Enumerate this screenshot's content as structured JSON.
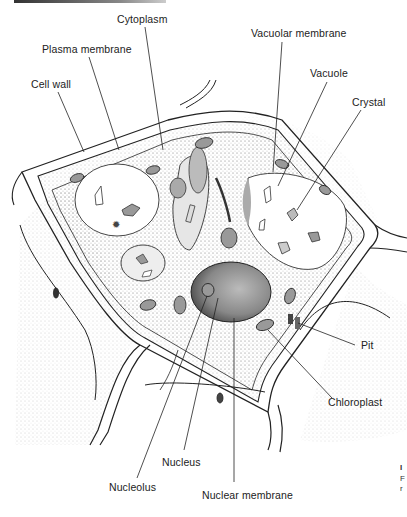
{
  "figure": {
    "labels": [
      {
        "id": "cytoplasm",
        "text": "Cytoplasm",
        "x": 117,
        "y": 19
      },
      {
        "id": "plasma-membrane",
        "text": "Plasma membrane",
        "x": 42,
        "y": 49
      },
      {
        "id": "cell-wall",
        "text": "Cell wall",
        "x": 31,
        "y": 84
      },
      {
        "id": "vacuolar-membrane",
        "text": "Vacuolar membrane",
        "x": 251,
        "y": 33
      },
      {
        "id": "vacuole",
        "text": "Vacuole",
        "x": 310,
        "y": 73
      },
      {
        "id": "crystal",
        "text": "Crystal",
        "x": 352,
        "y": 102
      },
      {
        "id": "pit",
        "text": "Pit",
        "x": 361,
        "y": 342
      },
      {
        "id": "chloroplast",
        "text": "Chloroplast",
        "x": 328,
        "y": 401
      },
      {
        "id": "nucleus",
        "text": "Nucleus",
        "x": 162,
        "y": 456
      },
      {
        "id": "nucleolus",
        "text": "Nucleolus",
        "x": 109,
        "y": 484
      },
      {
        "id": "nuclear-membrane",
        "text": "Nuclear membrane",
        "x": 202,
        "y": 491
      }
    ],
    "edge_fragments": [
      "I",
      "F",
      "r"
    ],
    "colors": {
      "ink": "#222222",
      "stipple": "#9a9a9a",
      "background": "#ffffff"
    }
  }
}
